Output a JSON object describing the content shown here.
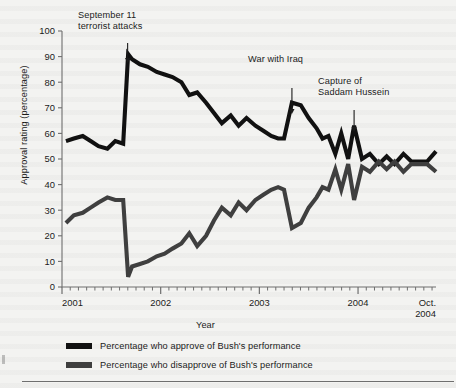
{
  "figure": {
    "background_color": "#f3f3f1",
    "approve_color": "#111111",
    "disapprove_color": "#3f3f3f"
  },
  "annotations": {
    "sept11": {
      "line1": "September 11",
      "line2": "terrorist attacks"
    },
    "iraq": {
      "line1": "War with Iraq",
      "line2": ""
    },
    "saddam": {
      "line1": "Capture of",
      "line2": "Saddam Hussein"
    }
  },
  "axes": {
    "ylabel": "Approval rating (percentage)",
    "xlabel": "Year",
    "yticks": [
      "0",
      "10",
      "20",
      "30",
      "40",
      "50",
      "60",
      "70",
      "80",
      "90",
      "100"
    ],
    "xticks": [
      "2001",
      "2002",
      "2003",
      "2004"
    ],
    "xtick_end_line1": "Oct.",
    "xtick_end_line2": "2004"
  },
  "legend": {
    "items": [
      {
        "label": "Percentage who approve of Bush's performance",
        "color": "#111111"
      },
      {
        "label": "Percentage who disapprove of Bush's performance",
        "color": "#3f3f3f"
      }
    ]
  },
  "chart_data": {
    "type": "line",
    "title": "",
    "xlabel": "Year",
    "ylabel": "Approval rating (percentage)",
    "ylim": [
      0,
      100
    ],
    "xlim": [
      2001.0,
      2004.79
    ],
    "grid": false,
    "legend_position": "below-axis",
    "xtick_labels": [
      "2001",
      "2002",
      "2003",
      "2004",
      "Oct. 2004"
    ],
    "xtick_values": [
      2001,
      2002,
      2003,
      2004,
      2004.79
    ],
    "ytick_values": [
      0,
      10,
      20,
      30,
      40,
      50,
      60,
      70,
      80,
      90,
      100
    ],
    "annotations": [
      {
        "text": "September 11 terrorist attacks",
        "x": 2001.7,
        "y": 91
      },
      {
        "text": "War with Iraq",
        "x": 2003.22,
        "y": 72
      },
      {
        "text": "Capture of Saddam Hussein",
        "x": 2003.95,
        "y": 63
      }
    ],
    "x": [
      2001.04,
      2001.12,
      2001.21,
      2001.29,
      2001.37,
      2001.46,
      2001.54,
      2001.62,
      2001.67,
      2001.71,
      2001.79,
      2001.87,
      2001.96,
      2002.04,
      2002.12,
      2002.21,
      2002.29,
      2002.37,
      2002.46,
      2002.54,
      2002.62,
      2002.71,
      2002.79,
      2002.87,
      2002.96,
      2003.04,
      2003.12,
      2003.19,
      2003.25,
      2003.33,
      2003.42,
      2003.5,
      2003.58,
      2003.64,
      2003.7,
      2003.77,
      2003.83,
      2003.9,
      2003.96,
      2004.04,
      2004.12,
      2004.21,
      2004.29,
      2004.37,
      2004.46,
      2004.54,
      2004.62,
      2004.7,
      2004.79
    ],
    "series": [
      {
        "name": "Percentage who approve of Bush's performance",
        "color": "#111111",
        "values": [
          57,
          58,
          59,
          57,
          55,
          54,
          57,
          56,
          91,
          89,
          87,
          86,
          84,
          83,
          82,
          80,
          75,
          76,
          72,
          68,
          64,
          67,
          63,
          66,
          63,
          61,
          59,
          58,
          58,
          72,
          71,
          66,
          62,
          58,
          59,
          52,
          60,
          50,
          63,
          50,
          52,
          48,
          51,
          48,
          52,
          49,
          49,
          49,
          53
        ]
      },
      {
        "name": "Percentage who disapprove of Bush's performance",
        "color": "#3f3f3f",
        "values": [
          25,
          28,
          29,
          31,
          33,
          35,
          34,
          34,
          4,
          8,
          9,
          10,
          12,
          13,
          15,
          17,
          21,
          16,
          20,
          26,
          31,
          28,
          33,
          30,
          34,
          36,
          38,
          39,
          38,
          23,
          25,
          31,
          35,
          39,
          38,
          46,
          38,
          48,
          34,
          47,
          45,
          49,
          46,
          49,
          45,
          48,
          48,
          48,
          45
        ]
      }
    ]
  }
}
